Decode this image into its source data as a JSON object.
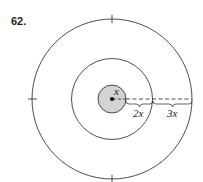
{
  "problem_number": "62.",
  "labels": {
    "inner_radius": "x",
    "middle_gap": "2x",
    "outer_gap": "3x"
  },
  "colors": {
    "stroke": "#231f20",
    "inner_fill": "#d3d3d3"
  },
  "geometry": {
    "center": [
      112,
      99
    ],
    "radii": [
      14,
      40.5,
      80
    ]
  }
}
